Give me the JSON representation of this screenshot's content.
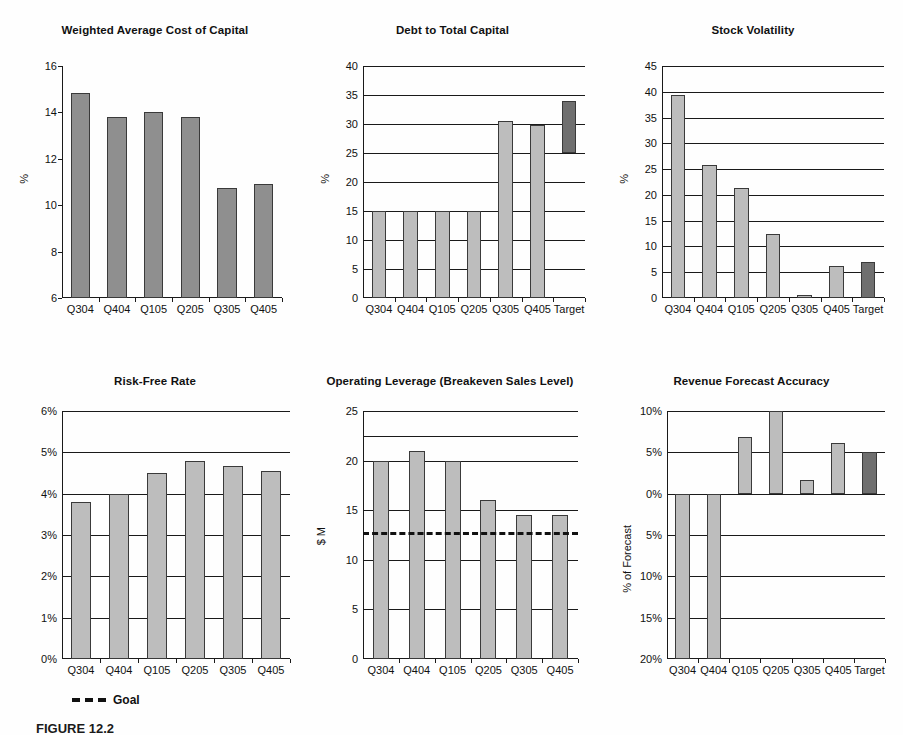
{
  "page": {
    "caption": "FIGURE 12.2",
    "legend_label": "Goal"
  },
  "chart_data": [
    {
      "id": "wacc",
      "type": "bar",
      "title": "Weighted Average Cost of Capital",
      "xlabel": "",
      "ylabel": "%",
      "ylim": [
        6,
        16
      ],
      "yticks": [
        6,
        8,
        10,
        12,
        14,
        16
      ],
      "ytick_labels": [
        "6",
        "8",
        "10",
        "12",
        "14",
        "16"
      ],
      "grid": false,
      "categories": [
        "Q304",
        "Q404",
        "Q105",
        "Q205",
        "Q305",
        "Q405"
      ],
      "values": [
        14.85,
        13.8,
        14.0,
        13.8,
        10.75,
        10.9
      ],
      "bar_style": [
        "dark",
        "dark",
        "dark",
        "dark",
        "dark",
        "dark"
      ],
      "goal_line": null,
      "legend": []
    },
    {
      "id": "debt-to-total-capital",
      "type": "bar",
      "title": "Debt to Total Capital",
      "xlabel": "",
      "ylabel": "%",
      "ylim": [
        0,
        40
      ],
      "yticks": [
        0,
        5,
        10,
        15,
        20,
        25,
        30,
        35,
        40
      ],
      "ytick_labels": [
        "0",
        "5",
        "10",
        "15",
        "20",
        "25",
        "30",
        "35",
        "40"
      ],
      "grid": true,
      "categories": [
        "Q304",
        "Q404",
        "Q105",
        "Q205",
        "Q305",
        "Q405",
        "Target"
      ],
      "values": [
        15,
        15,
        15,
        15,
        30.5,
        29.8,
        34
      ],
      "bases": [
        0,
        0,
        0,
        0,
        0,
        0,
        25
      ],
      "bar_style": [
        "light",
        "light",
        "light",
        "light",
        "light",
        "light",
        "target"
      ],
      "goal_line": null,
      "legend": []
    },
    {
      "id": "stock-volatility",
      "type": "bar",
      "title": "Stock Volatility",
      "xlabel": "",
      "ylabel": "%",
      "ylim": [
        0,
        45
      ],
      "yticks": [
        0,
        5,
        10,
        15,
        20,
        25,
        30,
        35,
        40,
        45
      ],
      "ytick_labels": [
        "0",
        "5",
        "10",
        "15",
        "20",
        "25",
        "30",
        "35",
        "40",
        "45"
      ],
      "grid": true,
      "categories": [
        "Q304",
        "Q404",
        "Q105",
        "Q205",
        "Q305",
        "Q405",
        "Target"
      ],
      "values": [
        39.3,
        25.8,
        21.4,
        12.5,
        0.6,
        6.3,
        7.0
      ],
      "bases": [
        0,
        0,
        0,
        0,
        0,
        0,
        0
      ],
      "bar_style": [
        "light",
        "light",
        "light",
        "light",
        "light",
        "light",
        "target"
      ],
      "goal_line": null,
      "legend": []
    },
    {
      "id": "risk-free-rate",
      "type": "bar",
      "title": "Risk-Free Rate",
      "xlabel": "",
      "ylabel": "",
      "ylim": [
        0,
        6
      ],
      "yticks": [
        0,
        1,
        2,
        3,
        4,
        5,
        6
      ],
      "ytick_labels": [
        "0%",
        "1%",
        "2%",
        "3%",
        "4%",
        "5%",
        "6%"
      ],
      "grid": true,
      "categories": [
        "Q304",
        "Q404",
        "Q105",
        "Q205",
        "Q305",
        "Q405"
      ],
      "values": [
        3.8,
        4.0,
        4.5,
        4.78,
        4.68,
        4.55
      ],
      "bases": [
        0,
        0,
        0,
        0,
        0,
        0
      ],
      "bar_style": [
        "light",
        "light",
        "light",
        "light",
        "light",
        "light"
      ],
      "goal_line": null,
      "legend": [
        "Goal"
      ]
    },
    {
      "id": "operating-leverage",
      "type": "bar",
      "title": "Operating Leverage (Breakeven Sales Level)",
      "xlabel": "",
      "ylabel": "$ M",
      "ylim": [
        0,
        25
      ],
      "yticks": [
        0,
        5,
        10,
        15,
        20,
        25
      ],
      "ytick_labels": [
        "0",
        "5",
        "10",
        "15",
        "20",
        "25"
      ],
      "minor_yticks": [
        22.5
      ],
      "grid": true,
      "categories": [
        "Q304",
        "Q404",
        "Q105",
        "Q205",
        "Q305",
        "Q405"
      ],
      "values": [
        20.0,
        21.0,
        20.0,
        16.0,
        14.5,
        14.5
      ],
      "bases": [
        0,
        0,
        0,
        0,
        0,
        0
      ],
      "bar_style": [
        "light",
        "light",
        "light",
        "light",
        "light",
        "light"
      ],
      "goal_line": 12.8,
      "legend": []
    },
    {
      "id": "revenue-forecast-accuracy",
      "type": "bar",
      "title": "Revenue Forecast Accuracy",
      "xlabel": "",
      "ylabel": "% of Forecast",
      "ylim": [
        -20,
        10
      ],
      "yticks": [
        -20,
        -15,
        -10,
        -5,
        0,
        5,
        10
      ],
      "ytick_labels": [
        "20%",
        "15%",
        "10%",
        "5%",
        "0%",
        "5%",
        "10%"
      ],
      "grid": true,
      "categories": [
        "Q304",
        "Q404",
        "Q105",
        "Q205",
        "Q305",
        "Q405",
        "Target"
      ],
      "values": [
        -20.0,
        -20.0,
        6.8,
        10.0,
        1.6,
        6.1,
        5.0
      ],
      "bases": [
        0,
        0,
        0,
        0,
        0,
        0,
        0
      ],
      "bar_style": [
        "light",
        "light",
        "light",
        "light",
        "light",
        "light",
        "target"
      ],
      "goal_line": null,
      "legend": []
    }
  ]
}
